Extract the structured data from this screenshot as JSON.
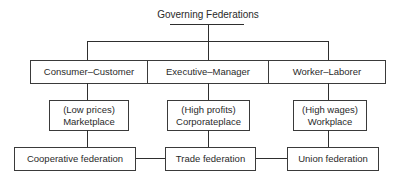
{
  "diagram": {
    "title": "Governing Federations",
    "row1": [
      {
        "label": "Consumer–Customer"
      },
      {
        "label": "Executive–Manager"
      },
      {
        "label": "Worker–Laborer"
      }
    ],
    "row2": [
      {
        "line1": "(Low prices)",
        "line2": "Marketplace"
      },
      {
        "line1": "(High profits)",
        "line2": "Corporateplace"
      },
      {
        "line1": "(High wages)",
        "line2": "Workplace"
      }
    ],
    "row3": [
      {
        "label": "Cooperative federation"
      },
      {
        "label": "Trade federation"
      },
      {
        "label": "Union federation"
      }
    ]
  }
}
